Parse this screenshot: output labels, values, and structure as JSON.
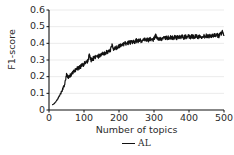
{
  "chart_data": {
    "type": "line",
    "title": "",
    "xlabel": "Number of topics",
    "ylabel": "F1-score",
    "xlim": [
      0,
      500
    ],
    "ylim": [
      0,
      0.6
    ],
    "grid": "horizontal",
    "legend_position": "below-axis",
    "xticks": [
      0,
      100,
      200,
      300,
      400,
      500
    ],
    "xtick_labels": [
      "0",
      "100",
      "200",
      "300",
      "400",
      "500"
    ],
    "yticks": [
      0,
      0.1,
      0.2,
      0.3,
      0.4,
      0.5,
      0.6
    ],
    "ytick_labels": [
      "0",
      "0.1",
      "0.2",
      "0.3",
      "0.4",
      "0.5",
      "0.6"
    ],
    "series": [
      {
        "name": "AL",
        "color": "#111111",
        "x": [
          10,
          15,
          20,
          25,
          30,
          35,
          40,
          45,
          50,
          55,
          60,
          65,
          70,
          75,
          80,
          85,
          90,
          95,
          100,
          105,
          110,
          115,
          120,
          125,
          130,
          135,
          140,
          145,
          150,
          155,
          160,
          165,
          170,
          175,
          180,
          185,
          190,
          195,
          200,
          205,
          210,
          215,
          220,
          225,
          230,
          235,
          240,
          245,
          250,
          255,
          260,
          265,
          270,
          275,
          280,
          285,
          290,
          295,
          300,
          305,
          310,
          315,
          320,
          325,
          330,
          335,
          340,
          345,
          350,
          355,
          360,
          365,
          370,
          375,
          380,
          385,
          390,
          395,
          400,
          405,
          410,
          415,
          420,
          425,
          430,
          435,
          440,
          445,
          450,
          455,
          460,
          465,
          470,
          475,
          480,
          485,
          490,
          495,
          500
        ],
        "values": [
          0.032,
          0.038,
          0.05,
          0.066,
          0.085,
          0.105,
          0.13,
          0.155,
          0.215,
          0.19,
          0.205,
          0.218,
          0.228,
          0.24,
          0.248,
          0.252,
          0.262,
          0.268,
          0.276,
          0.284,
          0.29,
          0.33,
          0.3,
          0.308,
          0.314,
          0.318,
          0.32,
          0.327,
          0.332,
          0.337,
          0.34,
          0.348,
          0.352,
          0.357,
          0.392,
          0.365,
          0.372,
          0.378,
          0.384,
          0.388,
          0.392,
          0.396,
          0.4,
          0.404,
          0.404,
          0.408,
          0.412,
          0.41,
          0.416,
          0.414,
          0.418,
          0.415,
          0.42,
          0.418,
          0.422,
          0.419,
          0.424,
          0.421,
          0.426,
          0.448,
          0.424,
          0.428,
          0.43,
          0.427,
          0.432,
          0.43,
          0.434,
          0.431,
          0.436,
          0.433,
          0.437,
          0.434,
          0.438,
          0.436,
          0.439,
          0.435,
          0.44,
          0.437,
          0.441,
          0.438,
          0.442,
          0.44,
          0.443,
          0.439,
          0.444,
          0.441,
          0.445,
          0.442,
          0.446,
          0.443,
          0.447,
          0.444,
          0.448,
          0.445,
          0.449,
          0.446,
          0.452,
          0.47,
          0.448
        ],
        "noise_amplitude": 0.013
      }
    ]
  },
  "legend": {
    "entries": [
      {
        "label": "AL",
        "color": "#111111"
      }
    ]
  },
  "axes": {
    "spine_color": "#111111",
    "grid_color": "#e2e2e2"
  }
}
